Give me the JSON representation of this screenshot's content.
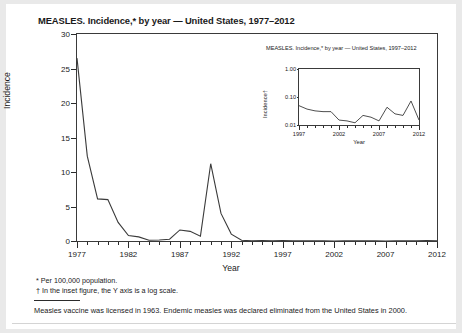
{
  "figure": {
    "title": "MEASLES. Incidence,* by year — United States, 1977–2012",
    "xlabel": "Year",
    "ylabel": "Incidence",
    "footnotes": [
      "* Per 100,000 population.",
      "† In the inset figure, the Y axis is a log scale."
    ],
    "caption": "Measles vaccine was licensed in 1963. Endemic measles was declared eliminated from the United States in 2000."
  },
  "chart_data": [
    {
      "type": "line",
      "id": "main",
      "title": "MEASLES. Incidence,* by year — United States, 1977–2012",
      "xlabel": "Year",
      "ylabel": "Incidence",
      "xlim": [
        1977,
        2012
      ],
      "ylim": [
        0,
        30
      ],
      "yticks": [
        0,
        5,
        10,
        15,
        20,
        25,
        30
      ],
      "ytick_labels": [
        "0",
        "5",
        "10",
        "15",
        "20",
        "25",
        "30"
      ],
      "xticks": [
        1977,
        1982,
        1987,
        1992,
        1997,
        2002,
        2007,
        2012
      ],
      "xtick_labels": [
        "1977",
        "1982",
        "1987",
        "1992",
        "1997",
        "2002",
        "2007",
        "2012"
      ],
      "minor_xticks": true,
      "grid": false,
      "legend": "none",
      "line_color": "#3a3a3a",
      "x": [
        1977,
        1978,
        1979,
        1980,
        1981,
        1982,
        1983,
        1984,
        1985,
        1986,
        1987,
        1988,
        1989,
        1990,
        1991,
        1992,
        1993,
        1994,
        1995,
        1996,
        1997,
        1998,
        1999,
        2000,
        2001,
        2002,
        2003,
        2004,
        2005,
        2006,
        2007,
        2008,
        2009,
        2010,
        2011,
        2012
      ],
      "values": [
        26.5,
        12.3,
        6.1,
        6.0,
        2.7,
        0.8,
        0.6,
        0.1,
        0.15,
        0.25,
        1.6,
        1.4,
        0.7,
        11.2,
        4.0,
        1.0,
        0.1,
        0.04,
        0.05,
        0.02,
        0.05,
        0.04,
        0.03,
        0.03,
        0.02,
        0.01,
        0.02,
        0.02,
        0.02,
        0.02,
        0.01,
        0.04,
        0.02,
        0.02,
        0.07,
        0.02
      ]
    },
    {
      "type": "line",
      "id": "inset",
      "title": "MEASLES. Incidence,* by year — United States, 1997–2012",
      "xlabel": "Year",
      "ylabel": "Incidence†",
      "yscale": "log",
      "xlim": [
        1997,
        2012
      ],
      "ylim": [
        0.01,
        1.0
      ],
      "yticks": [
        0.01,
        0.1,
        1.0
      ],
      "ytick_labels": [
        "0.01",
        "0.10",
        "1.00"
      ],
      "xticks": [
        1997,
        2002,
        2007,
        2012
      ],
      "xtick_labels": [
        "1997",
        "2002",
        "2007",
        "2012"
      ],
      "minor_xticks": true,
      "grid": false,
      "legend": "none",
      "line_color": "#3a3a3a",
      "x": [
        1997,
        1998,
        1999,
        2000,
        2001,
        2002,
        2003,
        2004,
        2005,
        2006,
        2007,
        2008,
        2009,
        2010,
        2011,
        2012
      ],
      "values": [
        0.049,
        0.037,
        0.032,
        0.03,
        0.03,
        0.015,
        0.014,
        0.012,
        0.022,
        0.019,
        0.014,
        0.043,
        0.025,
        0.022,
        0.072,
        0.015
      ]
    }
  ]
}
